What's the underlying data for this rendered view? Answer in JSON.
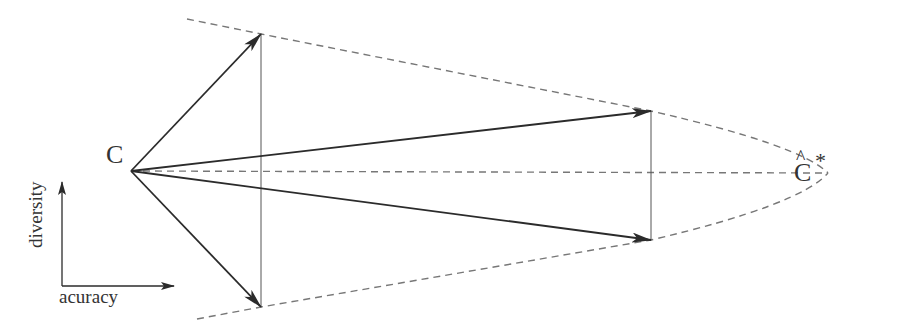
{
  "diagram": {
    "origin_label": "C",
    "target_label": "C",
    "target_hat": "^",
    "target_star": "*",
    "axes": {
      "x_label": "acuracy",
      "y_label": "diversity"
    },
    "colors": {
      "line": "#333333",
      "dashed": "#777777",
      "thin": "#555555"
    },
    "points": {
      "origin": [
        131,
        171
      ],
      "top_left": [
        261,
        34
      ],
      "bottom_left": [
        261,
        307
      ],
      "top_right": [
        651,
        111
      ],
      "bottom_right": [
        651,
        240
      ],
      "apex": [
        828,
        173
      ]
    }
  }
}
